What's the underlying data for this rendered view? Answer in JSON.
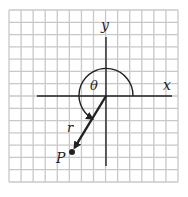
{
  "diagram": {
    "type": "polar-coordinates",
    "grid": {
      "cols": 14,
      "rows": 14,
      "left": 9,
      "top": 10,
      "right": 178,
      "bottom": 182,
      "line_color": "#c8c8c8"
    },
    "origin": {
      "x": 106,
      "y": 96
    },
    "axes": {
      "x": {
        "label": "x",
        "x1": 37,
        "x2": 172
      },
      "y": {
        "label": "y",
        "y1": 37,
        "y2": 166
      },
      "color": "#222222"
    },
    "angle": {
      "label": "θ",
      "radius": 27
    },
    "radius_vector": {
      "label": "r"
    },
    "point": {
      "label": "P",
      "x": 72,
      "y": 152
    }
  }
}
